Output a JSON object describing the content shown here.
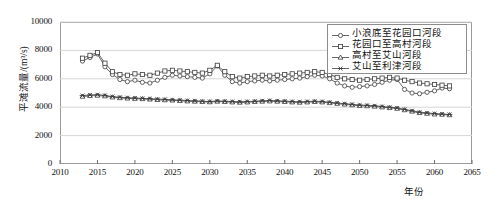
{
  "chart_data": {
    "type": "line",
    "title": "",
    "xlabel": "年份",
    "ylabel": "平滩流量/(m³/s)",
    "xlim": [
      2010,
      2065
    ],
    "ylim": [
      0,
      10000
    ],
    "xticks": [
      2010,
      2015,
      2020,
      2025,
      2030,
      2035,
      2040,
      2045,
      2050,
      2055,
      2060,
      2065
    ],
    "yticks": [
      0,
      2000,
      4000,
      6000,
      8000,
      10000
    ],
    "grid": "horizontal",
    "legend_position": "top-right",
    "x": [
      2013,
      2014,
      2015,
      2016,
      2017,
      2018,
      2019,
      2020,
      2021,
      2022,
      2023,
      2024,
      2025,
      2026,
      2027,
      2028,
      2029,
      2030,
      2031,
      2032,
      2033,
      2034,
      2035,
      2036,
      2037,
      2038,
      2039,
      2040,
      2041,
      2042,
      2043,
      2044,
      2045,
      2046,
      2047,
      2048,
      2049,
      2050,
      2051,
      2052,
      2053,
      2054,
      2055,
      2056,
      2057,
      2058,
      2059,
      2060,
      2061,
      2062
    ],
    "series": [
      {
        "name": "小浪底至花园口河段",
        "marker": "circle",
        "values": [
          7250,
          7500,
          7750,
          6850,
          6300,
          5950,
          5800,
          5900,
          5750,
          5700,
          5900,
          6100,
          6250,
          6200,
          6150,
          6100,
          6050,
          6350,
          6900,
          6250,
          5800,
          5700,
          5800,
          5850,
          5900,
          5850,
          5900,
          5950,
          6000,
          6050,
          6150,
          6250,
          6200,
          6000,
          5700,
          5500,
          5400,
          5450,
          5500,
          5600,
          5750,
          5900,
          5950,
          5250,
          5000,
          4950,
          5050,
          5150,
          5350,
          5300
        ]
      },
      {
        "name": "花园口至高村河段",
        "marker": "square",
        "values": [
          7450,
          7650,
          7850,
          7100,
          6500,
          6300,
          6250,
          6350,
          6300,
          6250,
          6400,
          6550,
          6600,
          6550,
          6500,
          6450,
          6400,
          6600,
          6950,
          6500,
          6150,
          6050,
          6150,
          6200,
          6250,
          6200,
          6250,
          6300,
          6350,
          6400,
          6450,
          6500,
          6450,
          6300,
          6100,
          6000,
          5950,
          5900,
          5950,
          6000,
          6050,
          6100,
          6050,
          5900,
          5800,
          5700,
          5650,
          5600,
          5550,
          5500
        ]
      },
      {
        "name": "高村至艾山河段",
        "marker": "triangle",
        "values": [
          4750,
          4800,
          4820,
          4780,
          4700,
          4650,
          4620,
          4600,
          4580,
          4550,
          4520,
          4500,
          4480,
          4450,
          4420,
          4400,
          4380,
          4360,
          4400,
          4380,
          4350,
          4330,
          4350,
          4380,
          4400,
          4420,
          4400,
          4380,
          4350,
          4330,
          4350,
          4380,
          4350,
          4300,
          4250,
          4200,
          4150,
          4100,
          4080,
          4050,
          4000,
          3950,
          3900,
          3800,
          3700,
          3600,
          3550,
          3500,
          3480,
          3450
        ]
      },
      {
        "name": "艾山至利津河段",
        "marker": "asterisk",
        "values": [
          4820,
          4860,
          4880,
          4830,
          4750,
          4700,
          4670,
          4650,
          4620,
          4600,
          4570,
          4550,
          4520,
          4500,
          4470,
          4450,
          4420,
          4400,
          4440,
          4420,
          4400,
          4380,
          4400,
          4420,
          4450,
          4470,
          4450,
          4430,
          4400,
          4380,
          4400,
          4420,
          4400,
          4350,
          4300,
          4250,
          4200,
          4150,
          4130,
          4100,
          4050,
          4000,
          3950,
          3850,
          3750,
          3650,
          3600,
          3550,
          3520,
          3490
        ]
      }
    ]
  }
}
